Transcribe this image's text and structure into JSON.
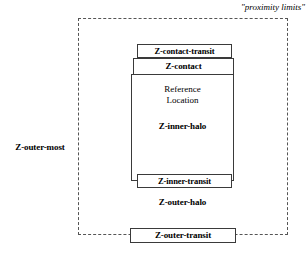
{
  "diagram": {
    "title_annotation": "\"proximity limits\"",
    "zones": {
      "outer_most": "Z-outer-most",
      "outer_transit": "Z-outer-transit",
      "outer_halo": "Z-outer-halo",
      "inner_transit": "Z-inner-transit",
      "inner_halo": "Z-inner-halo",
      "contact": "Z-contact",
      "contact_transit": "Z-contact-transit",
      "reference_location_line1": "Reference",
      "reference_location_line2": "Location"
    },
    "colors": {
      "background": "#ffffff",
      "stroke_solid": "#3a3a3a",
      "stroke_dashed": "#555555",
      "text": "#000000"
    }
  }
}
